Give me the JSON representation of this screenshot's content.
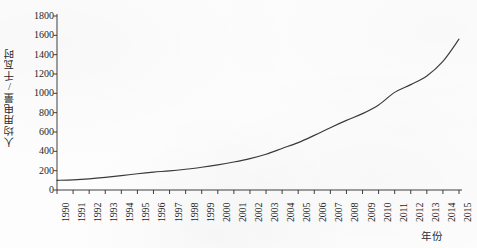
{
  "chart_data": {
    "type": "line",
    "title": "",
    "subtitle": "",
    "xlabel": "年份",
    "ylabel": "人均用电量/千瓦时",
    "xlim": [
      1990,
      2015
    ],
    "ylim": [
      0,
      1800
    ],
    "grid": false,
    "legend": null,
    "legend_position": "none",
    "line_color": "#3a3a3a",
    "categories": [
      "1990",
      "1991",
      "1992",
      "1993",
      "1994",
      "1995",
      "1996",
      "1997",
      "1998",
      "1999",
      "2000",
      "2001",
      "2002",
      "2003",
      "2004",
      "2005",
      "2006",
      "2007",
      "2008",
      "2009",
      "2010",
      "2011",
      "2012",
      "2013",
      "2014",
      "2015"
    ],
    "x": [
      1990,
      1991,
      1992,
      1993,
      1994,
      1995,
      1996,
      1997,
      1998,
      1999,
      2000,
      2001,
      2002,
      2003,
      2004,
      2005,
      2006,
      2007,
      2008,
      2009,
      2010,
      2011,
      2012,
      2013,
      2014,
      2015
    ],
    "values": [
      100,
      105,
      115,
      130,
      148,
      168,
      185,
      198,
      215,
      235,
      260,
      290,
      325,
      370,
      430,
      490,
      565,
      645,
      720,
      790,
      880,
      1010,
      1090,
      1180,
      1330,
      1560
    ],
    "series": [
      {
        "name": "人均用电量",
        "values": [
          100,
          105,
          115,
          130,
          148,
          168,
          185,
          198,
          215,
          235,
          260,
          290,
          325,
          370,
          430,
          490,
          565,
          645,
          720,
          790,
          880,
          1010,
          1090,
          1180,
          1330,
          1560
        ]
      }
    ],
    "ytick_labels": [
      "0",
      "200",
      "400",
      "600",
      "800",
      "1000",
      "1200",
      "1400",
      "1600",
      "1800"
    ],
    "ytick_values": [
      0,
      200,
      400,
      600,
      800,
      1000,
      1200,
      1400,
      1600,
      1800
    ],
    "xtick_labels": [
      "1990",
      "1991",
      "1992",
      "1993",
      "1994",
      "1995",
      "1996",
      "1997",
      "1998",
      "1999",
      "2000",
      "2001",
      "2002",
      "2003",
      "2004",
      "2005",
      "2006",
      "2007",
      "2008",
      "2009",
      "2010",
      "2011",
      "2012",
      "2013",
      "2014",
      "2015"
    ],
    "annotations": []
  }
}
